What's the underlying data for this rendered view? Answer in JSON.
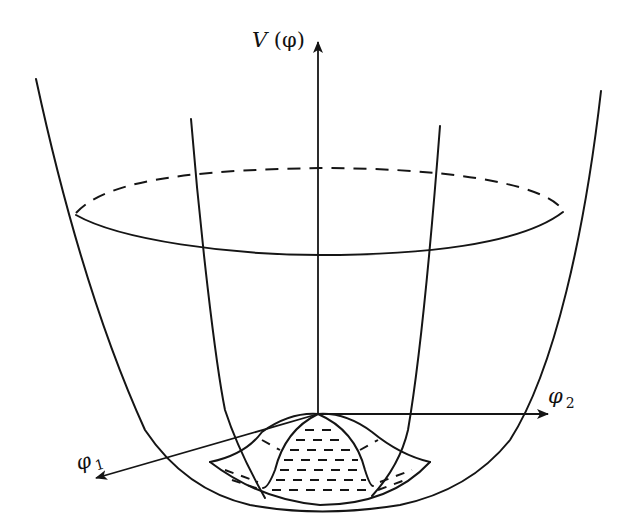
{
  "figure": {
    "colors": {
      "ink": "#151515",
      "background": "#ffffff"
    }
  },
  "axes": {
    "vertical": {
      "label": "V",
      "arg": "(φ)"
    },
    "right": {
      "symbol": "φ",
      "subscript": "2"
    },
    "left": {
      "symbol": "φ",
      "subscript": "1"
    }
  },
  "elements": [
    "outer-bowl-surface",
    "inner-meridian-curves",
    "upper-level-ellipse-front-solid",
    "upper-level-ellipse-back-dashed",
    "central-hump-at-origin",
    "dashed-shaded-trough"
  ]
}
